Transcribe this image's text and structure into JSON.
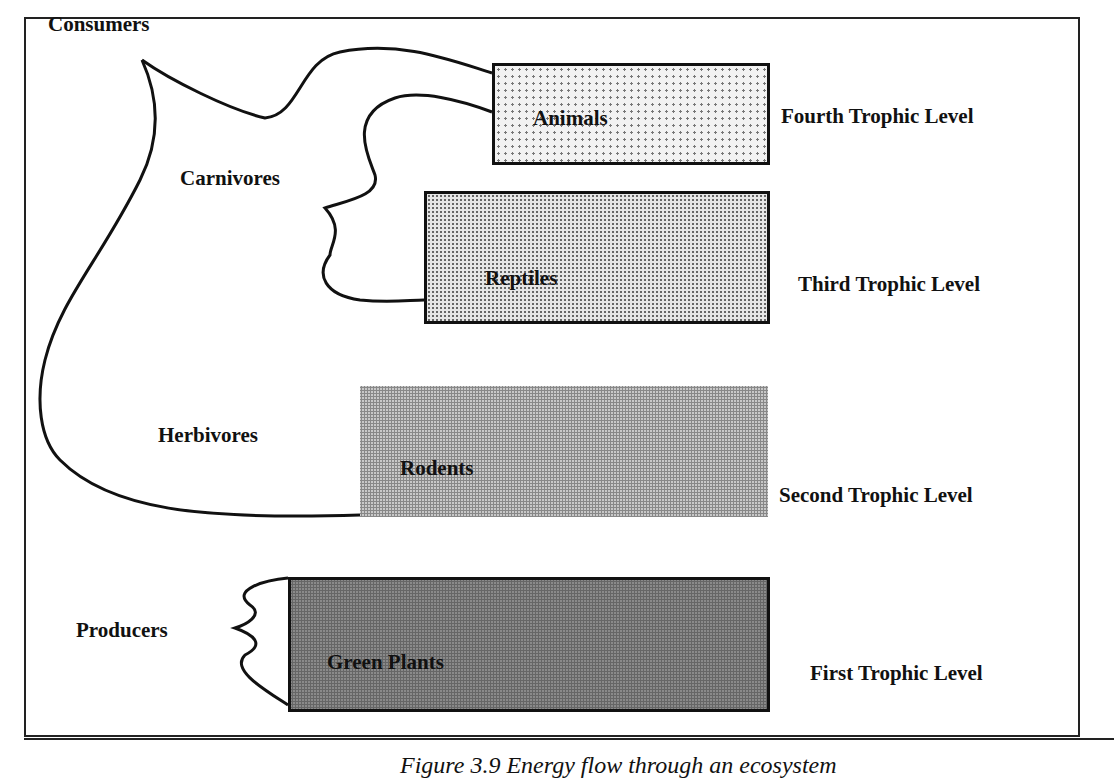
{
  "diagram": {
    "type": "trophic-levels",
    "groups": {
      "consumers": "Consumers",
      "carnivores": "Carnivores",
      "herbivores": "Herbivores",
      "producers": "Producers"
    },
    "boxes": [
      {
        "label": "Animals",
        "level": "Fourth Trophic Level"
      },
      {
        "label": "Reptiles",
        "level": "Third Trophic Level"
      },
      {
        "label": "Rodents",
        "level": "Second Trophic Level"
      },
      {
        "label": "Green Plants",
        "level": "First Trophic Level"
      }
    ]
  },
  "caption": "Figure 3.9 Energy flow through an ecosystem"
}
